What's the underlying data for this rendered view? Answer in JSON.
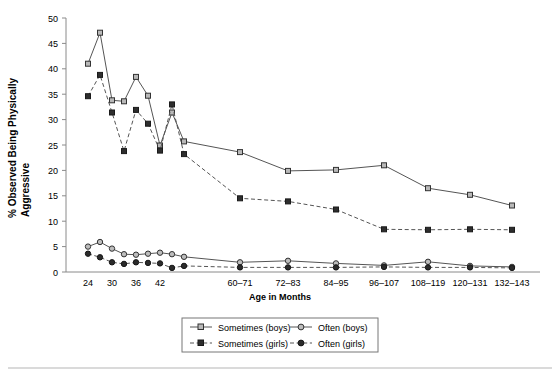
{
  "chart_data": {
    "type": "line",
    "title": "",
    "xlabel": "Age in Months",
    "ylabel": "% Observed Being Physically Aggressive",
    "ylim": [
      0,
      50
    ],
    "yticks": [
      0,
      5,
      10,
      15,
      20,
      25,
      30,
      35,
      40,
      45,
      50
    ],
    "grid": false,
    "legend_position": "bottom",
    "xtick_labels": [
      "24",
      "30",
      "36",
      "42",
      "60–71",
      "72–83",
      "84–95",
      "96–107",
      "108–119",
      "120–131",
      "132–143"
    ],
    "xtick_index": [
      0,
      2,
      4,
      6,
      11,
      12,
      13,
      14,
      15,
      16,
      17
    ],
    "x": [
      "24",
      "27",
      "30",
      "33",
      "36",
      "39",
      "42",
      "45",
      "48",
      "51",
      "54",
      "60-71",
      "72-83",
      "84-95",
      "96-107",
      "108-119",
      "120-131",
      "132-143"
    ],
    "series": [
      {
        "name": "Sometimes (boys)",
        "marker": "open-square",
        "line": "solid",
        "values": [
          41.0,
          47.1,
          33.8,
          33.6,
          38.4,
          34.7,
          24.9,
          31.4,
          25.7,
          null,
          null,
          23.6,
          19.9,
          20.1,
          21.0,
          16.5,
          15.2,
          13.1
        ]
      },
      {
        "name": "Sometimes (girls)",
        "marker": "filled-square",
        "line": "dashed",
        "values": [
          34.6,
          38.8,
          31.4,
          23.8,
          31.9,
          29.2,
          23.9,
          33.0,
          23.2,
          null,
          null,
          14.5,
          13.9,
          12.3,
          8.4,
          8.3,
          8.4,
          8.3
        ]
      },
      {
        "name": "Often (boys)",
        "marker": "open-circle",
        "line": "solid",
        "values": [
          5.0,
          5.9,
          4.6,
          3.5,
          3.4,
          3.6,
          3.8,
          3.5,
          3.0,
          null,
          null,
          1.9,
          2.2,
          1.7,
          1.3,
          2.0,
          1.2,
          1.0
        ],
        "y2_note": ""
      },
      {
        "name": "Often (girls)",
        "marker": "filled-circle",
        "line": "dashed",
        "values": [
          3.6,
          2.9,
          1.9,
          1.6,
          1.9,
          1.8,
          1.7,
          0.8,
          1.2,
          null,
          null,
          0.9,
          0.9,
          0.9,
          1.0,
          0.9,
          0.9,
          0.8
        ]
      }
    ],
    "colors": {
      "line": "#555555",
      "marker_open": "#b9b9b9",
      "marker_filled": "#2e2e2e",
      "axis": "#8a8a8a"
    }
  },
  "legend": {
    "entries": [
      {
        "label": "Sometimes (boys)"
      },
      {
        "label": "Often (boys)"
      },
      {
        "label": "Sometimes (girls)"
      },
      {
        "label": "Often (girls)"
      }
    ]
  },
  "axes": {
    "y_title": "% Observed Being Physically Aggressive",
    "x_title": "Age in Months"
  }
}
